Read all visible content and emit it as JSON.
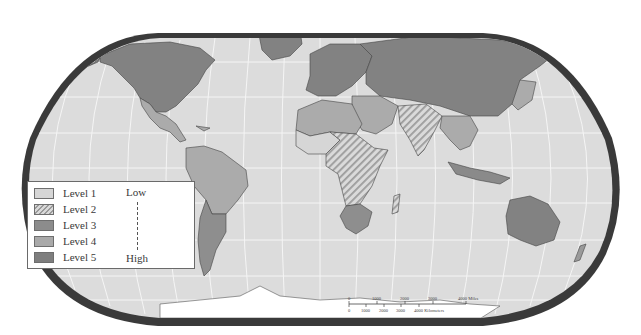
{
  "map": {
    "projection": "Robinson",
    "theme": "World map shaded by level",
    "colors": {
      "ocean": "#dcdcdc",
      "graticule": "#f4f4f4",
      "frame": "#3c3c3c",
      "level_1": "#d6d6d6",
      "level_2_hatch_light": "#d9d9d9",
      "level_2_hatch_dark": "#9a9a9a",
      "level_3": "#8c8c8c",
      "level_4": "#a9a9a9",
      "level_5": "#7e7e7e",
      "antarctica": "#ffffff"
    },
    "regions": [
      {
        "name": "North America (USA/Canada)",
        "level": 5
      },
      {
        "name": "Greenland",
        "level": 5
      },
      {
        "name": "Mexico",
        "level": 4
      },
      {
        "name": "Central America",
        "level": 4
      },
      {
        "name": "South America (north)",
        "level": 4
      },
      {
        "name": "Brazil",
        "level": 4
      },
      {
        "name": "Southern Cone",
        "level": 3
      },
      {
        "name": "Europe",
        "level": 5
      },
      {
        "name": "Russia / Northern Asia",
        "level": 5
      },
      {
        "name": "China",
        "level": 5
      },
      {
        "name": "North Africa",
        "level": 4
      },
      {
        "name": "Sahel / West Africa",
        "level": 1
      },
      {
        "name": "Central & East Africa",
        "level": 2
      },
      {
        "name": "Southern Africa",
        "level": 4
      },
      {
        "name": "Madagascar",
        "level": 2
      },
      {
        "name": "Middle East",
        "level": 4
      },
      {
        "name": "India / South Asia",
        "level": 2
      },
      {
        "name": "Southeast Asia",
        "level": 4
      },
      {
        "name": "Indonesia",
        "level": 4
      },
      {
        "name": "Japan / Korea",
        "level": 4
      },
      {
        "name": "Australia",
        "level": 5
      },
      {
        "name": "Antarctica",
        "level": 0
      }
    ]
  },
  "legend": {
    "items": [
      {
        "label": "Level 1",
        "level": 1
      },
      {
        "label": "Level 2",
        "level": 2
      },
      {
        "label": "Level 3",
        "level": 3
      },
      {
        "label": "Level 4",
        "level": 4
      },
      {
        "label": "Level 5",
        "level": 5
      }
    ],
    "low_label": "Low",
    "high_label": "High"
  },
  "scale_bar": {
    "miles_ticks": [
      "0",
      "1000",
      "2000",
      "3000",
      "4000 Miles"
    ],
    "km_ticks": [
      "0",
      "1000",
      "2000",
      "3000",
      "4000 Kilometers"
    ]
  }
}
